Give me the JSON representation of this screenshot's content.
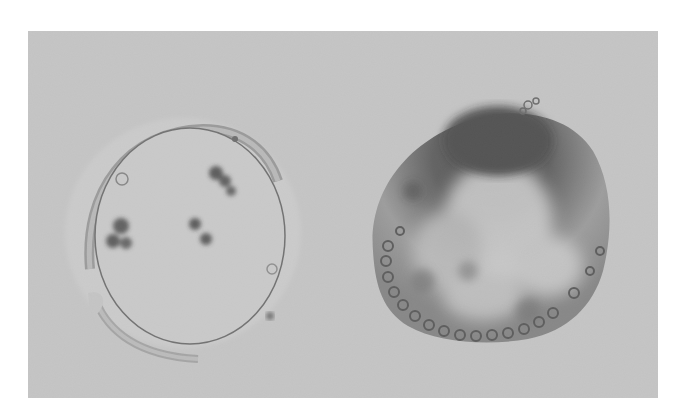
{
  "figure": {
    "kind": "grayscale micrograph",
    "background_color": "#c4c4c4",
    "page_color": "#ffffff",
    "subjects": [
      {
        "name": "left-cell",
        "description": "round cell with clear zona layer and several dark chromatin clusters",
        "fill": "#c9c9c9",
        "outline": "#555555"
      },
      {
        "name": "right-cell",
        "description": "degenerating cell with dark granular cytoplasm and beaded margin",
        "fill": "#8a8a8a",
        "dark": "#1e1e1e"
      }
    ]
  }
}
